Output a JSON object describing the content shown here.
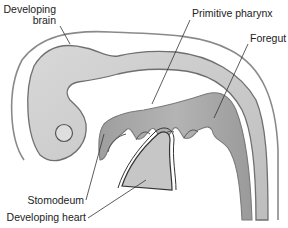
{
  "diagram": {
    "labels": {
      "developing_brain_line1": "Developing",
      "developing_brain_line2": "brain",
      "primitive_pharynx": "Primitive pharynx",
      "foregut": "Foregut",
      "stomodeum": "Stomodeum",
      "developing_heart": "Developing heart"
    },
    "colors": {
      "outline": "#8a8a8a",
      "neural_tube_fill": "#c9c9c9",
      "gut_fill": "#a9a9a9",
      "heart_fill": "#c6c6c6",
      "leader_line": "#333333",
      "text": "#222222"
    }
  }
}
